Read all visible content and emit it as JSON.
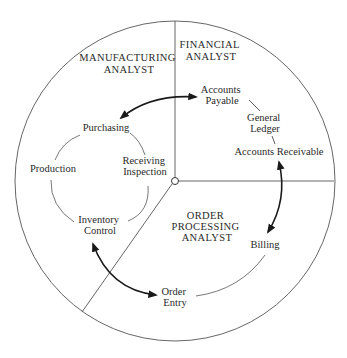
{
  "diagram": {
    "type": "circular-domain-diagram",
    "colors": {
      "line": "#555555",
      "text": "#2a2a2a",
      "arrow": "#1a1a1a",
      "background": "#ffffff"
    },
    "roles": [
      {
        "id": "manufacturing",
        "lines": [
          "MANUFACTURING",
          "ANALYST"
        ]
      },
      {
        "id": "financial",
        "lines": [
          "FINANCIAL",
          "ANALYST"
        ]
      },
      {
        "id": "order_processing",
        "lines": [
          "ORDER",
          "PROCESSING",
          "ANALYST"
        ]
      }
    ],
    "nodes": [
      {
        "id": "purchasing",
        "lines": [
          "Purchasing"
        ]
      },
      {
        "id": "production",
        "lines": [
          "Production"
        ]
      },
      {
        "id": "receiving_inspection",
        "lines": [
          "Receiving",
          "Inspection"
        ]
      },
      {
        "id": "inventory_control",
        "lines": [
          "Inventory",
          "Control"
        ]
      },
      {
        "id": "accounts_payable",
        "lines": [
          "Accounts",
          "Payable"
        ]
      },
      {
        "id": "general_ledger",
        "lines": [
          "General",
          "Ledger"
        ]
      },
      {
        "id": "accounts_receivable",
        "lines": [
          "Accounts Receivable"
        ]
      },
      {
        "id": "billing",
        "lines": [
          "Billing"
        ]
      },
      {
        "id": "order_entry",
        "lines": [
          "Order",
          "Entry"
        ]
      }
    ],
    "interfaces": [
      {
        "from": "purchasing",
        "to": "accounts_payable",
        "bidirectional": true
      },
      {
        "from": "accounts_receivable",
        "to": "billing",
        "bidirectional": true
      },
      {
        "from": "inventory_control",
        "to": "order_entry",
        "bidirectional": true
      }
    ]
  }
}
